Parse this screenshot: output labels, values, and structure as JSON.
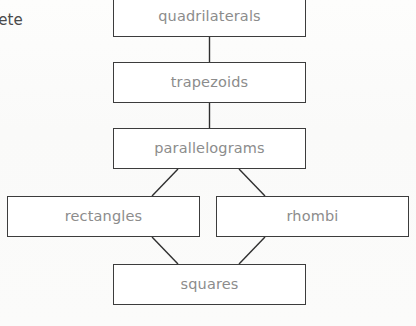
{
  "diagram": {
    "background_color": "#fbfbfa",
    "box_border_color": "#3c3c3c",
    "box_fill_color": "#ffffff",
    "label_color": "#8c8c8c",
    "edge_color": "#2f2f2f",
    "margin_text": "lete",
    "nodes": [
      {
        "id": "quadrilaterals",
        "label": "quadrilaterals",
        "x": 113,
        "y": -4,
        "width": 193,
        "height": 41
      },
      {
        "id": "trapezoids",
        "label": "trapezoids",
        "x": 113,
        "y": 62,
        "width": 193,
        "height": 41
      },
      {
        "id": "parallelograms",
        "label": "parallelograms",
        "x": 113,
        "y": 128,
        "width": 193,
        "height": 41
      },
      {
        "id": "rectangles",
        "label": "rectangles",
        "x": 7,
        "y": 196,
        "width": 193,
        "height": 41
      },
      {
        "id": "rhombi",
        "label": "rhombi",
        "x": 216,
        "y": 196,
        "width": 193,
        "height": 41
      },
      {
        "id": "squares",
        "label": "squares",
        "x": 113,
        "y": 264,
        "width": 193,
        "height": 41
      }
    ],
    "edges": [
      {
        "from": "quadrilaterals",
        "to": "trapezoids",
        "kind": "vertical",
        "x1": 209.5,
        "y1": 37,
        "x2": 209.5,
        "y2": 62
      },
      {
        "from": "trapezoids",
        "to": "parallelograms",
        "kind": "vertical",
        "x1": 209.5,
        "y1": 103,
        "x2": 209.5,
        "y2": 128
      },
      {
        "from": "parallelograms",
        "to": "rectangles",
        "kind": "diagonal",
        "x1": 178,
        "y1": 169,
        "x2": 152,
        "y2": 196
      },
      {
        "from": "parallelograms",
        "to": "rhombi",
        "kind": "diagonal",
        "x1": 239,
        "y1": 169,
        "x2": 265,
        "y2": 196
      },
      {
        "from": "rectangles",
        "to": "squares",
        "kind": "diagonal",
        "x1": 152,
        "y1": 237,
        "x2": 178,
        "y2": 264
      },
      {
        "from": "rhombi",
        "to": "squares",
        "kind": "diagonal",
        "x1": 265,
        "y1": 237,
        "x2": 239,
        "y2": 264
      }
    ]
  }
}
